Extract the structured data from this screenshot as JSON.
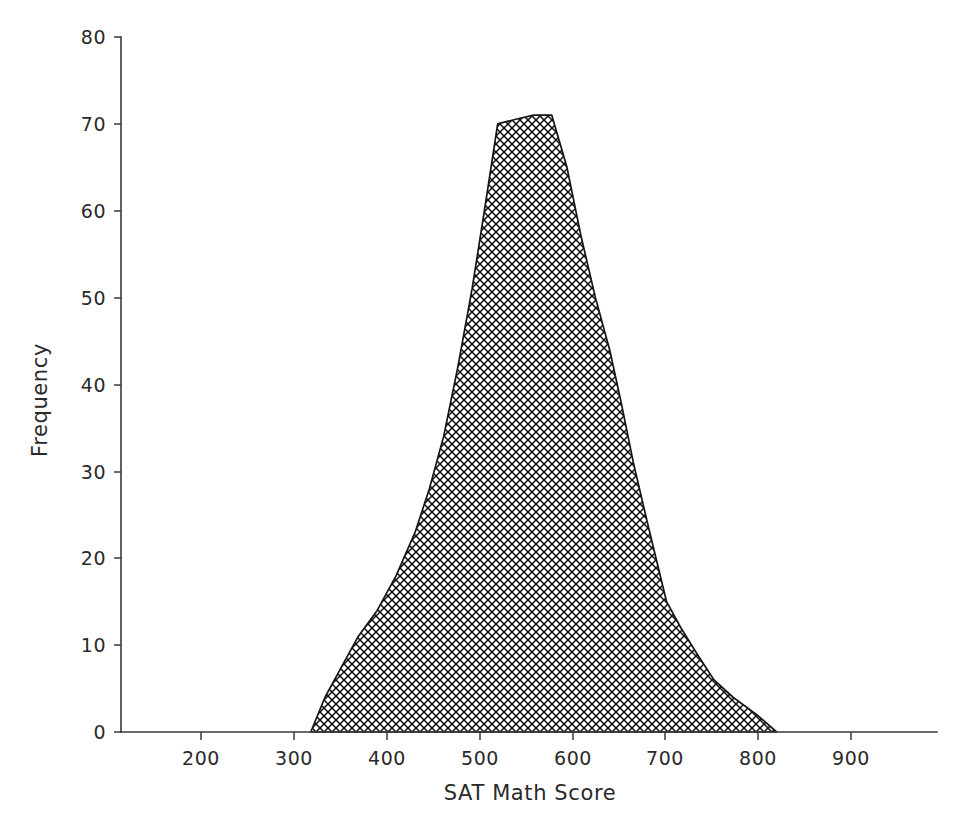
{
  "chart_data": {
    "type": "area",
    "title": "",
    "subtitle": "",
    "xlabel": "SAT Math Score",
    "ylabel": "Frequency",
    "xlim": [
      130,
      990
    ],
    "ylim": [
      0,
      80
    ],
    "xticks": [
      200,
      300,
      400,
      500,
      600,
      700,
      800,
      900
    ],
    "xtick_labels": [
      "200",
      "300",
      "400",
      "500",
      "600",
      "700",
      "800",
      "900"
    ],
    "yticks": [
      0,
      10,
      20,
      30,
      40,
      50,
      60,
      70,
      80
    ],
    "ytick_labels": [
      "0",
      "10",
      "20",
      "30",
      "40",
      "50",
      "60",
      "70",
      "80"
    ],
    "grid": false,
    "legend": false,
    "legend_position": "none",
    "fill_pattern": "cross-hatch",
    "fill_color": "#000000",
    "line_color": "#151515",
    "series": [
      {
        "name": "SAT Math Score frequency",
        "x": [
          330,
          345,
          360,
          380,
          400,
          420,
          440,
          455,
          470,
          485,
          500,
          513,
          527,
          545,
          565,
          584,
          600,
          615,
          630,
          645,
          657,
          670,
          685,
          705,
          720,
          737,
          755,
          775,
          800,
          821
        ],
        "values": [
          0,
          4,
          7,
          11,
          14,
          18,
          23,
          28,
          34,
          42,
          51,
          60,
          70,
          70.5,
          71,
          71,
          65,
          57,
          50,
          44,
          38,
          31,
          24,
          15,
          12,
          9,
          6,
          4,
          2,
          0
        ]
      }
    ],
    "annotations": [],
    "peak": {
      "score": 584,
      "frequency": 71
    },
    "range_nonzero": {
      "min_score": 330,
      "max_score": 821
    }
  },
  "axes": {
    "y_axis_title": "Frequency",
    "x_axis_title": "SAT Math Score"
  },
  "icons": {
    "y_tick_icon": "tick-mark",
    "x_tick_icon": "tick-mark"
  }
}
